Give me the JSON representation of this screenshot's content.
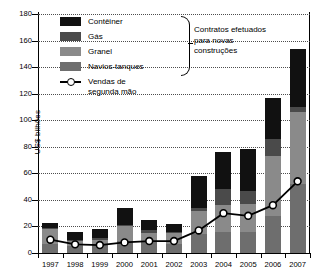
{
  "chart_data": {
    "type": "bar",
    "title": "",
    "subtitle": "",
    "xlabel": "",
    "ylabel": "US$ bilhões",
    "ylim": [
      0,
      180
    ],
    "ytick_step": 20,
    "grid": true,
    "legend_position": "top-left",
    "categories": [
      "1997",
      "1998",
      "1999",
      "2000",
      "2001",
      "2002",
      "2003",
      "2004",
      "2005",
      "2006",
      "2007"
    ],
    "series": [
      {
        "name": "Navios-tanques",
        "type": "bar",
        "stack": "contratos",
        "color": "#6e6e6e",
        "values": [
          7,
          5,
          6,
          9,
          8,
          7,
          14,
          16,
          16,
          28,
          52
        ]
      },
      {
        "name": "Granel",
        "type": "bar",
        "stack": "contratos",
        "color": "#8a8a8a",
        "values": [
          11,
          4,
          4,
          11,
          7,
          8,
          18,
          20,
          21,
          45,
          54
        ]
      },
      {
        "name": "Gás",
        "type": "bar",
        "stack": "contratos",
        "color": "#4a4a4a",
        "values": [
          1,
          1,
          1,
          1,
          2,
          1,
          2,
          12,
          10,
          13,
          4
        ]
      },
      {
        "name": "Contêiner",
        "type": "bar",
        "stack": "contratos",
        "color": "#111111",
        "values": [
          4,
          6,
          7,
          13,
          8,
          6,
          24,
          28,
          31,
          31,
          44
        ]
      },
      {
        "name": "Vendas de segunda mão",
        "type": "line",
        "color": "#000000",
        "marker": "circle-open",
        "values": [
          10,
          6.5,
          6,
          8,
          9,
          9,
          17,
          30,
          28,
          36,
          54
        ]
      }
    ],
    "bar_totals": [
      23,
      16,
      18,
      34,
      25,
      22,
      58,
      76,
      78,
      117,
      154
    ],
    "yticks": [
      0,
      20,
      40,
      60,
      80,
      100,
      120,
      140,
      160,
      180
    ]
  },
  "legend": {
    "items": [
      {
        "label": "Contêiner",
        "color": "#111111",
        "swatch": "color-swatch-container"
      },
      {
        "label": "Gás",
        "color": "#4a4a4a",
        "swatch": "color-swatch-gas"
      },
      {
        "label": "Granel",
        "color": "#8a8a8a",
        "swatch": "color-swatch-granel"
      },
      {
        "label": "Navios-tanques",
        "color": "#6e6e6e",
        "swatch": "color-swatch-navios-tanques"
      }
    ],
    "line_item": {
      "label_line1": "Vendas de",
      "label_line2": "segunda mão"
    }
  },
  "annotation": {
    "line1": "Contratos efetuados",
    "line2": "para novas",
    "line3": "construções"
  }
}
